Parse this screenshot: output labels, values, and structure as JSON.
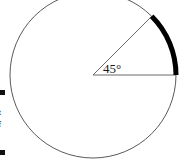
{
  "figure": {
    "name": "circle-with-45-degree-arc",
    "angle_label": "45°",
    "angle_degrees": 45,
    "colors": {
      "circle_stroke": "#5a5a5a",
      "radius_stroke": "#6b6b6b",
      "highlight_arc": "#000000",
      "background": "#ffffff",
      "label_text": "#1a1a1a"
    },
    "geometry": {
      "center_x": 93,
      "center_y": 75,
      "radius": 83,
      "circle_stroke_width": 1,
      "highlight_arc_stroke_width": 5,
      "arc_start_angle_deg": 0,
      "arc_end_angle_deg": 45,
      "horizontal_radius_end_x": 176,
      "horizontal_radius_end_y": 75,
      "diagonal_radius_end_x": 152,
      "diagonal_radius_end_y": 16
    },
    "label_position": {
      "x": 103,
      "y": 62
    }
  },
  "margin_text": {
    "bullets": [
      {
        "y": 90
      },
      {
        "y": 150
      }
    ],
    "fragments": [
      {
        "text": "t",
        "y": 108,
        "light": false
      },
      {
        "text": "f",
        "y": 120,
        "light": false
      },
      {
        "text": ".",
        "y": 133,
        "light": true
      }
    ]
  }
}
